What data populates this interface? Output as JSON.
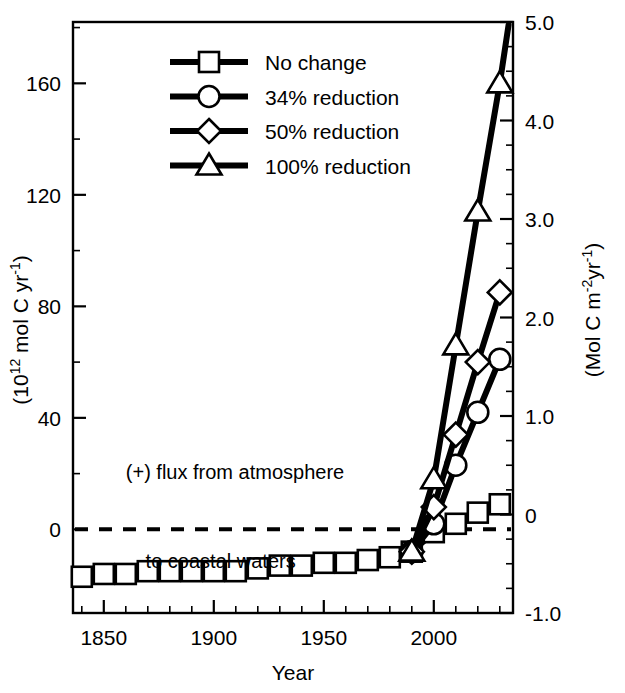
{
  "chart_data": {
    "type": "line",
    "title": "",
    "xlabel": "Year",
    "ylabel_left": "(10¹² mol C yr⁻¹)",
    "ylabel_right": "(Mol C m⁻²yr⁻¹)",
    "xlim": [
      1836,
      2036
    ],
    "ylim_left": [
      -30,
      182
    ],
    "ylim_right": [
      -1.0,
      5.0
    ],
    "xticks": [
      1850,
      1900,
      1950,
      2000
    ],
    "xtick_labels": [
      "1850",
      "1900",
      "1950",
      "2000"
    ],
    "xticks_minor_step": 10,
    "yticks_left": [
      0,
      40,
      80,
      120,
      160
    ],
    "ytick_labels_left": [
      "0",
      "40",
      "80",
      "120",
      "160"
    ],
    "yticks_minor_step_left": 20,
    "yticks_right": [
      -1.0,
      0,
      1.0,
      2.0,
      3.0,
      4.0,
      5.0
    ],
    "ytick_labels_right": [
      "-1.0",
      "0",
      "1.0",
      "2.0",
      "3.0",
      "4.0",
      "5.0"
    ],
    "yticks_minor_step_right": 0.25,
    "grid": false,
    "legend_position": "upper-left-inside",
    "annotations": [
      {
        "name": "flux-note-line1",
        "text": "(+) flux from atmosphere",
        "x": 1860,
        "y": 18
      },
      {
        "name": "flux-note-line2",
        "text": "to coastal waters",
        "x": 1869,
        "y": -14
      }
    ],
    "reference_lines": [
      {
        "name": "zero-line",
        "y": 0,
        "style": "dashed"
      }
    ],
    "series": [
      {
        "name": "No change",
        "marker": "square",
        "x": [
          1840,
          1850,
          1860,
          1870,
          1880,
          1890,
          1900,
          1910,
          1920,
          1930,
          1940,
          1950,
          1960,
          1970,
          1980,
          1990,
          2000,
          2010,
          2020,
          2030
        ],
        "values": [
          -17,
          -16,
          -16,
          -15,
          -15,
          -15,
          -15,
          -15,
          -14,
          -13,
          -13,
          -12,
          -12,
          -11,
          -10,
          -8,
          -1,
          2,
          6,
          9
        ]
      },
      {
        "name": "34% reduction",
        "marker": "circle",
        "x": [
          1990,
          2000,
          2010,
          2020,
          2030
        ],
        "values": [
          -8,
          2,
          23,
          42,
          61
        ]
      },
      {
        "name": "50% reduction",
        "marker": "diamond",
        "x": [
          1990,
          2000,
          2010,
          2020,
          2030
        ],
        "values": [
          -8,
          8,
          34,
          60,
          85
        ]
      },
      {
        "name": "100% reduction",
        "marker": "triangle",
        "x": [
          1990,
          2000,
          2010,
          2020,
          2030,
          2034
        ],
        "values": [
          -8,
          18,
          66,
          114,
          160,
          181
        ]
      }
    ]
  },
  "legend": {
    "entries": [
      {
        "label": "No change",
        "marker": "square"
      },
      {
        "label": "34% reduction",
        "marker": "circle"
      },
      {
        "label": "50% reduction",
        "marker": "diamond"
      },
      {
        "label": "100% reduction",
        "marker": "triangle"
      }
    ]
  },
  "axes": {
    "x_title": "Year",
    "left_title_parts": {
      "pre": "(10",
      "sup1": "12",
      "mid": " mol C yr",
      "sup2": "-1",
      "post": ")"
    },
    "right_title_parts": {
      "pre": "(Mol C m",
      "sup1": "-2",
      "mid": "yr",
      "sup2": "-1",
      "post": ")"
    }
  },
  "colors": {
    "line": "#000000",
    "marker_fill": "#ffffff",
    "background": "#ffffff"
  }
}
